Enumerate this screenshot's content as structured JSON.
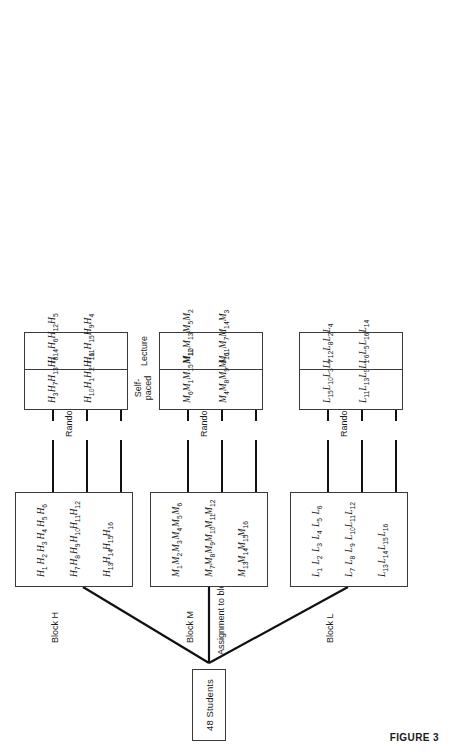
{
  "figure": {
    "caption": "FIGURE 3",
    "root_label": "48 Students",
    "assignment_to_blocks_label": "Assignment to blocks",
    "random_assignment_label": "Random assignment",
    "treatment_labels": {
      "self_paced_line1": "Self-",
      "self_paced_line2": "paced",
      "lecture": "Lecture"
    },
    "line_color": "#111111",
    "box_border_color": "#3a3a3a"
  },
  "blocks": [
    {
      "id": "block-h",
      "label": "Block H",
      "rows": [
        [
          "H1",
          "H2",
          "H3",
          "H4",
          "H5",
          "H6"
        ],
        [
          "H7",
          "H8",
          "H9",
          "H10",
          "H11",
          "H12"
        ],
        [
          "H13",
          "H14",
          "H15",
          "H16"
        ]
      ],
      "groups": [
        {
          "name": "self-paced",
          "rows": [
            [
              "H3",
              "H7",
              "H13",
              "H8"
            ],
            [
              "H10",
              "H1",
              "H2",
              "H16"
            ]
          ]
        },
        {
          "name": "lecture",
          "rows": [
            [
              "H14",
              "H6",
              "H12",
              "H5"
            ],
            [
              "H11",
              "H15",
              "H9",
              "H4"
            ]
          ]
        }
      ]
    },
    {
      "id": "block-m",
      "label": "Block M",
      "rows": [
        [
          "M1",
          "M2",
          "M3",
          "M4",
          "M5",
          "M6"
        ],
        [
          "M7",
          "M8",
          "M9",
          "M10",
          "M11",
          "M12"
        ],
        [
          "M13",
          "M14",
          "M15",
          "M16"
        ]
      ],
      "groups": [
        {
          "name": "self-paced",
          "rows": [
            [
              "M6",
              "M1",
              "M15",
              "M12"
            ],
            [
              "M4",
              "M8",
              "M9",
              "M16"
            ]
          ]
        },
        {
          "name": "lecture",
          "rows": [
            [
              "M10",
              "M13",
              "M5",
              "M2"
            ],
            [
              "M11",
              "M7",
              "M14",
              "M3"
            ]
          ]
        }
      ]
    },
    {
      "id": "block-l",
      "label": "Block L",
      "rows": [
        [
          "L1",
          "L2",
          "L3",
          "L4",
          "L5",
          "L6"
        ],
        [
          "L7",
          "L8",
          "L9",
          "L10",
          "L11",
          "L12"
        ],
        [
          "L13",
          "L14",
          "L15",
          "L16"
        ]
      ],
      "groups": [
        {
          "name": "self-paced",
          "rows": [
            [
              "L15",
              "L10",
              "L3",
              "L7"
            ],
            [
              "L11",
              "L13",
              "L9",
              "L1"
            ]
          ]
        },
        {
          "name": "lecture",
          "rows": [
            [
              "L12",
              "L8",
              "L2",
              "L4"
            ],
            [
              "L6",
              "L5",
              "L16",
              "L14"
            ]
          ]
        }
      ]
    }
  ]
}
